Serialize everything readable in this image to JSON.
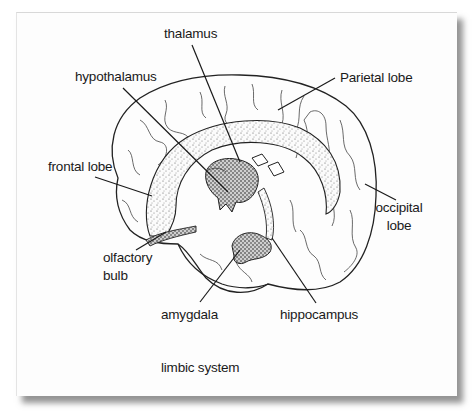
{
  "figure": {
    "caption": "limbic system",
    "labels": {
      "thalamus": "thalamus",
      "hypothalamus": "hypothalamus",
      "parietal_lobe": "Parietal lobe",
      "frontal_lobe": "frontal lobe",
      "occipital_lobe_line1": "occipital",
      "occipital_lobe_line2": "lobe",
      "olfactory_bulb_line1": "olfactory",
      "olfactory_bulb_line2": "bulb",
      "amygdala": "amygdala",
      "hippocampus": "hippocampus"
    },
    "colors": {
      "ink": "#1a1a1a",
      "paper": "#fdfdfd",
      "shadow": "#6e6e6e",
      "stipple": "#555555"
    }
  }
}
